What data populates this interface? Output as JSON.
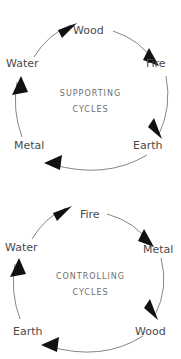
{
  "diagrams": [
    {
      "id": "supporting",
      "name": "supporting-cycles-diagram",
      "center": {
        "line1": "SUPPORTING",
        "line2": "CYCLES"
      },
      "nodes": [
        {
          "label": "Wood",
          "position": "top"
        },
        {
          "label": "Fire",
          "position": "upper-right"
        },
        {
          "label": "Earth",
          "position": "lower-right"
        },
        {
          "label": "Metal",
          "position": "lower-left"
        },
        {
          "label": "Water",
          "position": "upper-left"
        }
      ],
      "direction": "clockwise",
      "sequence": [
        "Wood",
        "Fire",
        "Earth",
        "Metal",
        "Water",
        "Wood"
      ]
    },
    {
      "id": "controlling",
      "name": "controlling-cycles-diagram",
      "center": {
        "line1": "CONTROLLING",
        "line2": "CYCLES"
      },
      "nodes": [
        {
          "label": "Fire",
          "position": "top"
        },
        {
          "label": "Metal",
          "position": "upper-right"
        },
        {
          "label": "Wood",
          "position": "lower-right"
        },
        {
          "label": "Earth",
          "position": "lower-left"
        },
        {
          "label": "Water",
          "position": "upper-left"
        }
      ],
      "direction": "clockwise",
      "sequence": [
        "Fire",
        "Metal",
        "Wood",
        "Earth",
        "Water",
        "Fire"
      ]
    }
  ],
  "colors": {
    "background": "#ffffff",
    "label_text": "#4a4a4a",
    "center_text": "#6d6d6d",
    "arc_stroke": "#777777",
    "arrow_head": "#111111"
  }
}
